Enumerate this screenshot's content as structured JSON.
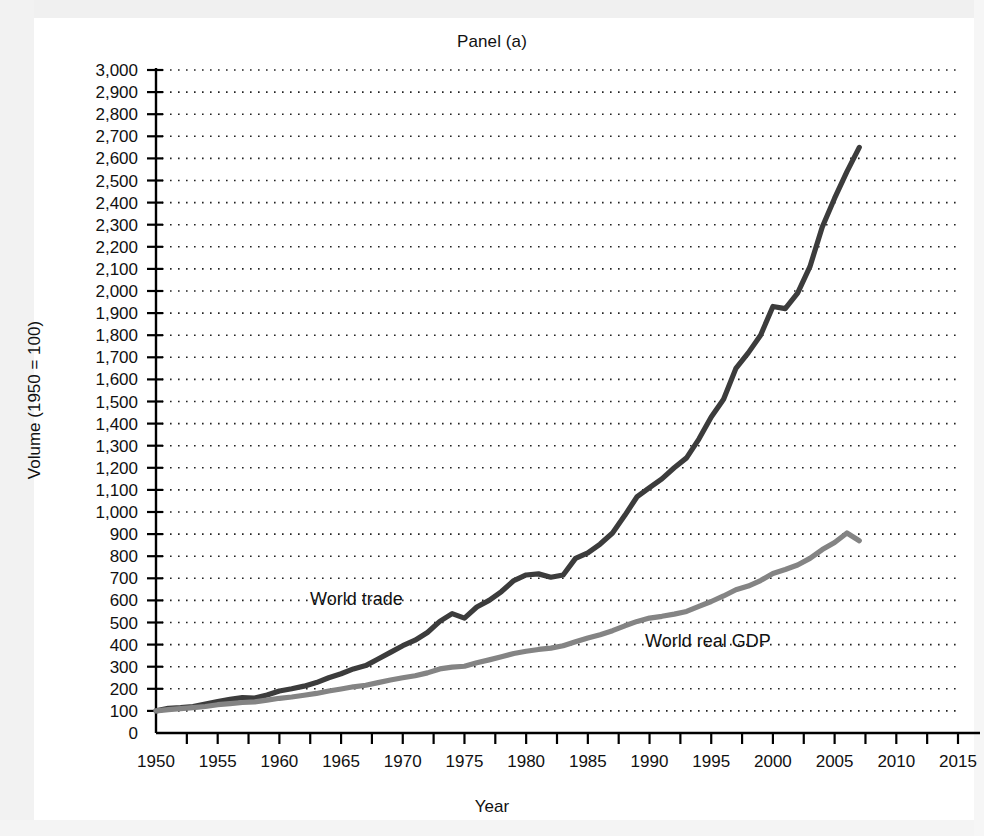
{
  "figure": {
    "title": "Panel (a)",
    "xlabel": "Year",
    "ylabel": "Volume (1950 = 100)"
  },
  "colors": {
    "trade_line": "#3c3c3c",
    "gdp_line": "#848484",
    "axis": "#000000",
    "grid": "#222222",
    "background": "#ffffff"
  },
  "annotations": {
    "trade_label": "World trade",
    "gdp_label": "World real GDP"
  },
  "chart_data": {
    "type": "line",
    "title": "Panel (a)",
    "xlabel": "Year",
    "ylabel": "Volume (1950 = 100)",
    "xlim": [
      1950,
      2015
    ],
    "ylim": [
      0,
      3000
    ],
    "xticks": [
      1950,
      1955,
      1960,
      1965,
      1970,
      1975,
      1980,
      1985,
      1990,
      1995,
      2000,
      2005,
      2010,
      2015
    ],
    "xtick_labels": [
      "1950",
      "1955",
      "1960",
      "1965",
      "1970",
      "1975",
      "1980",
      "1985",
      "1990",
      "1995",
      "2000",
      "2005",
      "2010",
      "2015"
    ],
    "yticks": [
      0,
      100,
      200,
      300,
      400,
      500,
      600,
      700,
      800,
      900,
      1000,
      1100,
      1200,
      1300,
      1400,
      1500,
      1600,
      1700,
      1800,
      1900,
      2000,
      2100,
      2200,
      2300,
      2400,
      2500,
      2600,
      2700,
      2800,
      2900,
      3000
    ],
    "ytick_labels": [
      "0",
      "100",
      "200",
      "300",
      "400",
      "500",
      "600",
      "700",
      "800",
      "900",
      "1,000",
      "1,100",
      "1,200",
      "1,300",
      "1,400",
      "1,500",
      "1,600",
      "1,700",
      "1,800",
      "1,900",
      "2,000",
      "2,100",
      "2,200",
      "2,300",
      "2,400",
      "2,500",
      "2,600",
      "2,700",
      "2,800",
      "2,900",
      "3,000"
    ],
    "grid": "horizontal-dotted",
    "legend": "inline-labels",
    "series": [
      {
        "name": "World trade",
        "color": "#3c3c3c",
        "x": [
          1950,
          1951,
          1952,
          1953,
          1954,
          1955,
          1956,
          1957,
          1958,
          1959,
          1960,
          1961,
          1962,
          1963,
          1964,
          1965,
          1966,
          1967,
          1968,
          1969,
          1970,
          1971,
          1972,
          1973,
          1974,
          1975,
          1976,
          1977,
          1978,
          1979,
          1980,
          1981,
          1982,
          1983,
          1984,
          1985,
          1986,
          1987,
          1988,
          1989,
          1990,
          1991,
          1992,
          1993,
          1994,
          1995,
          1996,
          1997,
          1998,
          1999,
          2000,
          2001,
          2002,
          2003,
          2004,
          2005,
          2006,
          2007
        ],
        "values": [
          100,
          112,
          115,
          120,
          131,
          142,
          152,
          160,
          158,
          172,
          190,
          200,
          212,
          228,
          250,
          268,
          290,
          305,
          335,
          365,
          395,
          420,
          455,
          505,
          540,
          520,
          570,
          600,
          640,
          690,
          715,
          720,
          705,
          715,
          790,
          815,
          855,
          905,
          985,
          1070,
          1110,
          1150,
          1200,
          1245,
          1330,
          1430,
          1510,
          1650,
          1720,
          1800,
          1930,
          1920,
          1990,
          2110,
          2290,
          2420,
          2540,
          2650
        ]
      },
      {
        "name": "World real GDP",
        "color": "#848484",
        "x": [
          1950,
          1951,
          1952,
          1953,
          1954,
          1955,
          1956,
          1957,
          1958,
          1959,
          1960,
          1961,
          1962,
          1963,
          1964,
          1965,
          1966,
          1967,
          1968,
          1969,
          1970,
          1971,
          1972,
          1973,
          1974,
          1975,
          1976,
          1977,
          1978,
          1979,
          1980,
          1981,
          1982,
          1983,
          1984,
          1985,
          1986,
          1987,
          1988,
          1989,
          1990,
          1991,
          1992,
          1993,
          1994,
          1995,
          1996,
          1997,
          1998,
          1999,
          2000,
          2001,
          2002,
          2003,
          2004,
          2005,
          2006,
          2007
        ],
        "values": [
          100,
          106,
          110,
          115,
          120,
          128,
          133,
          138,
          141,
          149,
          157,
          163,
          171,
          179,
          190,
          199,
          209,
          216,
          228,
          240,
          250,
          259,
          272,
          290,
          298,
          302,
          318,
          331,
          345,
          360,
          370,
          378,
          384,
          395,
          413,
          430,
          445,
          463,
          485,
          505,
          520,
          528,
          538,
          550,
          573,
          595,
          620,
          648,
          665,
          690,
          722,
          740,
          760,
          790,
          830,
          862,
          905,
          870
        ]
      }
    ]
  }
}
